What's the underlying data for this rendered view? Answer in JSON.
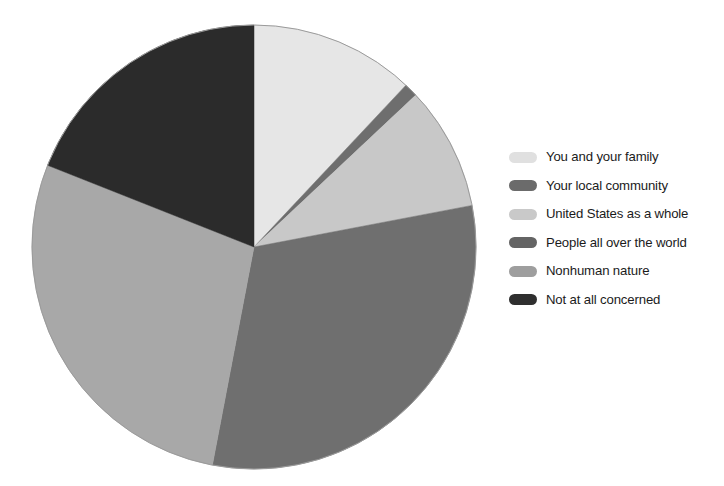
{
  "chart_data": {
    "type": "pie",
    "title": "",
    "subtitle": "",
    "xlabel": "",
    "ylabel": "",
    "legend_position": "right",
    "grid": false,
    "start_angle_deg": 0,
    "direction": "clockwise",
    "categories": [
      "You and your family",
      "Your local community",
      "United States as a whole",
      "People all over the world",
      "Nonhuman nature",
      "Not at all concerned"
    ],
    "values": [
      12,
      1,
      9,
      31,
      28,
      19
    ],
    "slices": [
      {
        "label": "You and your family",
        "value": 12,
        "color": "#e6e6e6",
        "start_deg": 0,
        "end_deg": 43.2
      },
      {
        "label": "Your local community",
        "value": 1,
        "color": "#6e6e6e",
        "start_deg": 43.2,
        "end_deg": 46.8
      },
      {
        "label": "United States as a whole",
        "value": 9,
        "color": "#c8c8c8",
        "start_deg": 46.8,
        "end_deg": 79.2
      },
      {
        "label": "People all over the world",
        "value": 31,
        "color": "#6f6f6f",
        "start_deg": 79.2,
        "end_deg": 190.8
      },
      {
        "label": "Nonhuman nature",
        "value": 28,
        "color": "#a8a8a8",
        "start_deg": 190.8,
        "end_deg": 291.6
      },
      {
        "label": "Not at all concerned",
        "value": 19,
        "color": "#2b2b2b",
        "start_deg": 291.6,
        "end_deg": 360
      }
    ],
    "geometry": {
      "center_x": 254,
      "center_y": 247,
      "radius": 222
    }
  },
  "legend": {
    "items": [
      {
        "label": "You and your family",
        "color": "#e0e0e0"
      },
      {
        "label": "Your local community",
        "color": "#6b6b6b"
      },
      {
        "label": "United States as a whole",
        "color": "#c9c9c9"
      },
      {
        "label": "People all over the world",
        "color": "#646464"
      },
      {
        "label": "Nonhuman nature",
        "color": "#9e9e9e"
      },
      {
        "label": "Not at all concerned",
        "color": "#2f2f2f"
      }
    ]
  }
}
